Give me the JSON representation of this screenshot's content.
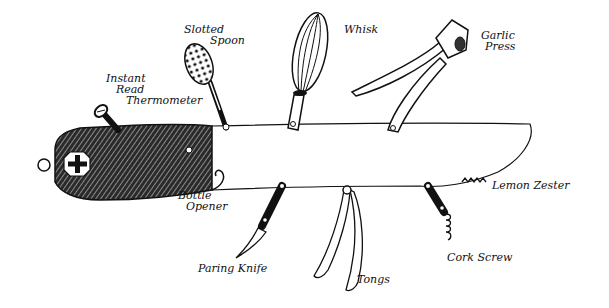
{
  "illustration": {
    "subject": "Swiss army knife of kitchen tools",
    "ink_color": "#111111",
    "background": "#ffffff"
  },
  "labels": {
    "thermometer": [
      "Instant",
      "Read",
      "Thermometer"
    ],
    "slotted_spoon": [
      "Slotted",
      "Spoon"
    ],
    "whisk": [
      "Whisk"
    ],
    "garlic_press": [
      "Garlic",
      "Press"
    ],
    "lemon_zester": [
      "Lemon Zester"
    ],
    "bottle_opener": [
      "Bottle",
      "Opener"
    ],
    "paring_knife": [
      "Paring Knife"
    ],
    "tongs": [
      "Tongs"
    ],
    "cork_screw": [
      "Cork Screw"
    ]
  }
}
